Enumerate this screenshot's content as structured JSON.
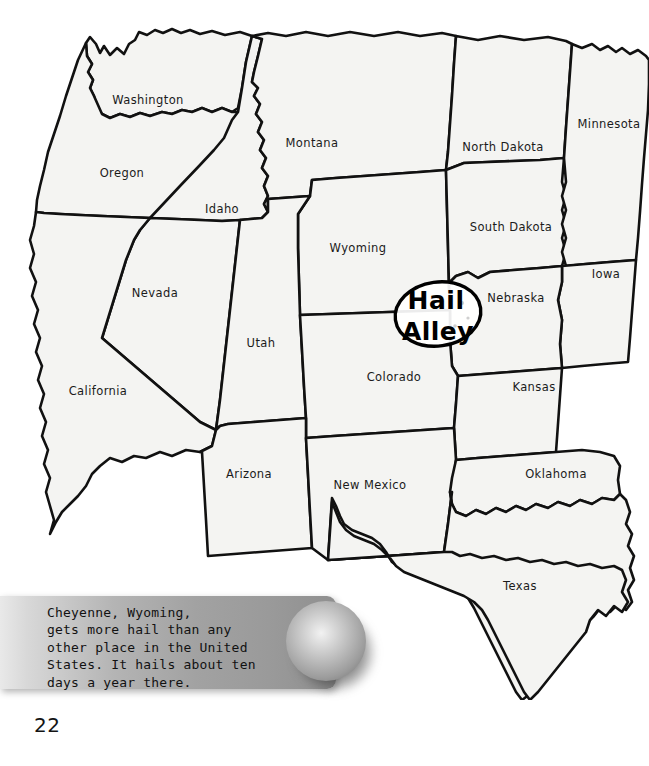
{
  "page": {
    "number": "22",
    "background_color": "#ffffff"
  },
  "map": {
    "title": "Western United States",
    "fill_color": "#f4f4f2",
    "outline_color": "#111111",
    "states": [
      {
        "name": "Washington",
        "label": "Washington",
        "x": 148,
        "y": 104
      },
      {
        "name": "Oregon",
        "label": "Oregon",
        "x": 122,
        "y": 177
      },
      {
        "name": "Idaho",
        "label": "Idaho",
        "x": 222,
        "y": 213
      },
      {
        "name": "Montana",
        "label": "Montana",
        "x": 312,
        "y": 147
      },
      {
        "name": "Wyoming",
        "label": "Wyoming",
        "x": 358,
        "y": 252
      },
      {
        "name": "North Dakota",
        "label": "North Dakota",
        "x": 503,
        "y": 151
      },
      {
        "name": "South Dakota",
        "label": "South Dakota",
        "x": 511,
        "y": 231
      },
      {
        "name": "Minnesota",
        "label": "Minnesota",
        "x": 609,
        "y": 128
      },
      {
        "name": "Iowa",
        "label": "Iowa",
        "x": 606,
        "y": 278
      },
      {
        "name": "Nebraska",
        "label": "Nebraska",
        "x": 516,
        "y": 302
      },
      {
        "name": "Nevada",
        "label": "Nevada",
        "x": 155,
        "y": 297
      },
      {
        "name": "Utah",
        "label": "Utah",
        "x": 261,
        "y": 347
      },
      {
        "name": "California",
        "label": "California",
        "x": 98,
        "y": 395
      },
      {
        "name": "Colorado",
        "label": "Colorado",
        "x": 394,
        "y": 381
      },
      {
        "name": "Kansas",
        "label": "Kansas",
        "x": 534,
        "y": 391
      },
      {
        "name": "Arizona",
        "label": "Arizona",
        "x": 249,
        "y": 478
      },
      {
        "name": "New Mexico",
        "label": "New Mexico",
        "x": 370,
        "y": 489
      },
      {
        "name": "Oklahoma",
        "label": "Oklahoma",
        "x": 556,
        "y": 478
      },
      {
        "name": "Texas",
        "label": "Texas",
        "x": 520,
        "y": 590
      }
    ]
  },
  "annotation": {
    "name": "hail-alley-callout",
    "line1": "Hail",
    "line2": "Alley",
    "style": "hand-drawn circled label",
    "outline_color": "#000000"
  },
  "caption": {
    "text": "Cheyenne, Wyoming,\ngets more hail than any\nother place in the United\nStates. It hails about ten\ndays a year there.",
    "background": "gray gradient bar"
  },
  "hailstone": {
    "name": "hailstone-sphere",
    "description": "gray shaded ball representing a hailstone",
    "color": "#b9b9b9"
  }
}
